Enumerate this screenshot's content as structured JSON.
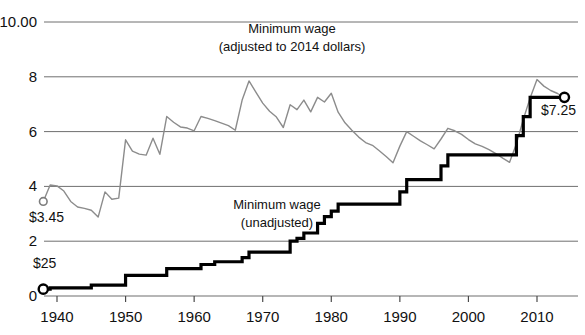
{
  "chart_data": {
    "type": "line",
    "title": "",
    "xlabel": "",
    "ylabel": "",
    "xlim": [
      1937,
      2015
    ],
    "ylim": [
      0,
      10
    ],
    "grid": true,
    "legend_position": "inline-annotations",
    "y_ticks": [
      "$10.00",
      "8",
      "6",
      "4",
      "2",
      "0"
    ],
    "y_tick_values": [
      10,
      8,
      6,
      4,
      2,
      0
    ],
    "x_ticks": [
      "1940",
      "1950",
      "1960",
      "1970",
      "1980",
      "1990",
      "2000",
      "2010"
    ],
    "x_tick_values": [
      1940,
      1950,
      1960,
      1970,
      1980,
      1990,
      2000,
      2010
    ],
    "annotations": [
      {
        "name": "adjusted-series-label",
        "line1": "Minimum wage",
        "line2": "(adjusted to 2014 dollars)"
      },
      {
        "name": "unadjusted-series-label",
        "line1": "Minimum wage",
        "line2": "(unadjusted)"
      },
      {
        "name": "adjusted-start-value",
        "text": "$3.45"
      },
      {
        "name": "unadjusted-start-value",
        "text": "$25"
      },
      {
        "name": "unadjusted-end-value",
        "text": "$7.25"
      }
    ],
    "series": [
      {
        "name": "Minimum wage (adjusted to 2014 dollars)",
        "color": "#8c8c8c",
        "start_label": "$3.45",
        "x": [
          1938,
          1939,
          1940,
          1941,
          1942,
          1943,
          1944,
          1945,
          1946,
          1947,
          1948,
          1949,
          1950,
          1951,
          1952,
          1953,
          1954,
          1955,
          1956,
          1957,
          1958,
          1959,
          1960,
          1961,
          1962,
          1963,
          1964,
          1965,
          1966,
          1967,
          1968,
          1969,
          1970,
          1971,
          1972,
          1973,
          1974,
          1975,
          1976,
          1977,
          1978,
          1979,
          1980,
          1981,
          1982,
          1983,
          1984,
          1985,
          1986,
          1987,
          1988,
          1989,
          1990,
          1991,
          1992,
          1993,
          1994,
          1995,
          1996,
          1997,
          1998,
          1999,
          2000,
          2001,
          2002,
          2003,
          2004,
          2005,
          2006,
          2007,
          2008,
          2009,
          2010,
          2011,
          2012,
          2013,
          2014
        ],
        "values": [
          3.45,
          4.05,
          4.02,
          3.83,
          3.45,
          3.25,
          3.2,
          3.13,
          2.88,
          3.8,
          3.53,
          3.57,
          5.7,
          5.29,
          5.18,
          5.14,
          5.76,
          5.17,
          6.55,
          6.34,
          6.17,
          6.13,
          6.03,
          6.55,
          6.48,
          6.4,
          6.31,
          6.22,
          6.05,
          7.15,
          7.85,
          7.44,
          7.04,
          6.74,
          6.53,
          6.15,
          6.98,
          6.8,
          7.15,
          6.72,
          7.25,
          7.08,
          7.4,
          6.71,
          6.32,
          6.05,
          5.8,
          5.6,
          5.5,
          5.3,
          5.09,
          4.86,
          5.47,
          6.0,
          5.83,
          5.66,
          5.52,
          5.37,
          5.73,
          6.12,
          6.03,
          5.9,
          5.71,
          5.55,
          5.46,
          5.34,
          5.2,
          5.03,
          4.88,
          5.56,
          6.44,
          7.23,
          7.9,
          7.66,
          7.5,
          7.39,
          7.25
        ]
      },
      {
        "name": "Minimum wage (unadjusted)",
        "color": "#000000",
        "start_label": "$25",
        "end_label": "$7.25",
        "x": [
          1938,
          1939,
          1940,
          1941,
          1942,
          1943,
          1944,
          1945,
          1946,
          1947,
          1948,
          1949,
          1950,
          1951,
          1952,
          1953,
          1954,
          1955,
          1956,
          1957,
          1958,
          1959,
          1960,
          1961,
          1962,
          1963,
          1964,
          1965,
          1966,
          1967,
          1968,
          1969,
          1970,
          1971,
          1972,
          1973,
          1974,
          1975,
          1976,
          1977,
          1978,
          1979,
          1980,
          1981,
          1982,
          1983,
          1984,
          1985,
          1986,
          1987,
          1988,
          1989,
          1990,
          1991,
          1992,
          1993,
          1994,
          1995,
          1996,
          1997,
          1998,
          1999,
          2000,
          2001,
          2002,
          2003,
          2004,
          2005,
          2006,
          2007,
          2008,
          2009,
          2010,
          2011,
          2012,
          2013,
          2014
        ],
        "values": [
          0.25,
          0.3,
          0.3,
          0.3,
          0.3,
          0.3,
          0.3,
          0.4,
          0.4,
          0.4,
          0.4,
          0.4,
          0.75,
          0.75,
          0.75,
          0.75,
          0.75,
          0.75,
          1.0,
          1.0,
          1.0,
          1.0,
          1.0,
          1.15,
          1.15,
          1.25,
          1.25,
          1.25,
          1.25,
          1.4,
          1.6,
          1.6,
          1.6,
          1.6,
          1.6,
          1.6,
          2.0,
          2.1,
          2.3,
          2.3,
          2.65,
          2.9,
          3.1,
          3.35,
          3.35,
          3.35,
          3.35,
          3.35,
          3.35,
          3.35,
          3.35,
          3.35,
          3.8,
          4.25,
          4.25,
          4.25,
          4.25,
          4.25,
          4.75,
          5.15,
          5.15,
          5.15,
          5.15,
          5.15,
          5.15,
          5.15,
          5.15,
          5.15,
          5.15,
          5.85,
          6.55,
          7.25,
          7.25,
          7.25,
          7.25,
          7.25,
          7.25
        ],
        "step": true
      }
    ]
  }
}
